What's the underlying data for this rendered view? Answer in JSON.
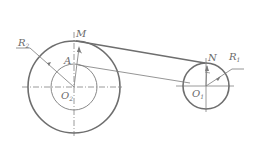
{
  "diagram": {
    "type": "belt-pulley mechanism",
    "labels": {
      "R2": {
        "main": "R",
        "sub": "2"
      },
      "R1": {
        "main": "R",
        "sub": "1"
      },
      "M": "M",
      "A": "A",
      "N": "N",
      "O2": {
        "main": "O",
        "sub": "2"
      },
      "O1": {
        "main": "O",
        "sub": "1"
      }
    },
    "colors": {
      "thick_stroke": "#6e6e6e",
      "thin_stroke": "#7a7a7a",
      "text": "#6a6a6a"
    }
  }
}
